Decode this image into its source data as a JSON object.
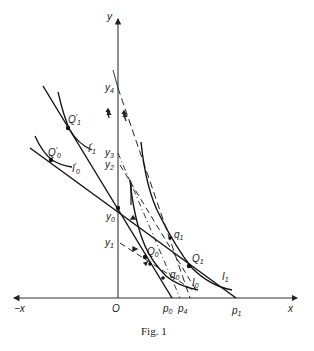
{
  "figure": {
    "caption": "Fig. 1",
    "axes": {
      "y_label": "y",
      "x_label": "x",
      "neg_x_label": "−x",
      "origin_label": "O"
    },
    "y_axis_points": [
      {
        "id": "y4",
        "base": "y",
        "sub": "4"
      },
      {
        "id": "y3",
        "base": "y",
        "sub": "3"
      },
      {
        "id": "y2",
        "base": "y",
        "sub": "2"
      },
      {
        "id": "y0",
        "base": "y",
        "sub": "0"
      },
      {
        "id": "y1",
        "base": "y",
        "sub": "1"
      }
    ],
    "x_axis_points": [
      {
        "id": "p0",
        "base": "p",
        "sub": "0"
      },
      {
        "id": "p4",
        "base": "p",
        "sub": "4"
      },
      {
        "id": "p1",
        "base": "p",
        "sub": "1"
      }
    ],
    "points": [
      {
        "id": "Q1prime",
        "base": "Q",
        "sub": "1",
        "prime": "′"
      },
      {
        "id": "Q0prime",
        "base": "Q",
        "sub": "0",
        "prime": "′"
      },
      {
        "id": "Q0",
        "base": "Q",
        "sub": "0"
      },
      {
        "id": "Q1",
        "base": "Q",
        "sub": "1"
      },
      {
        "id": "q0",
        "base": "q",
        "sub": "0"
      },
      {
        "id": "q1",
        "base": "q",
        "sub": "1"
      }
    ],
    "curves": [
      {
        "id": "I1prime",
        "base": "I",
        "sub": "1",
        "prime": "′"
      },
      {
        "id": "I0prime",
        "base": "I",
        "sub": "0",
        "prime": "′"
      },
      {
        "id": "I1",
        "base": "I",
        "sub": "1"
      },
      {
        "id": "I0",
        "base": "I",
        "sub": "0"
      }
    ]
  }
}
